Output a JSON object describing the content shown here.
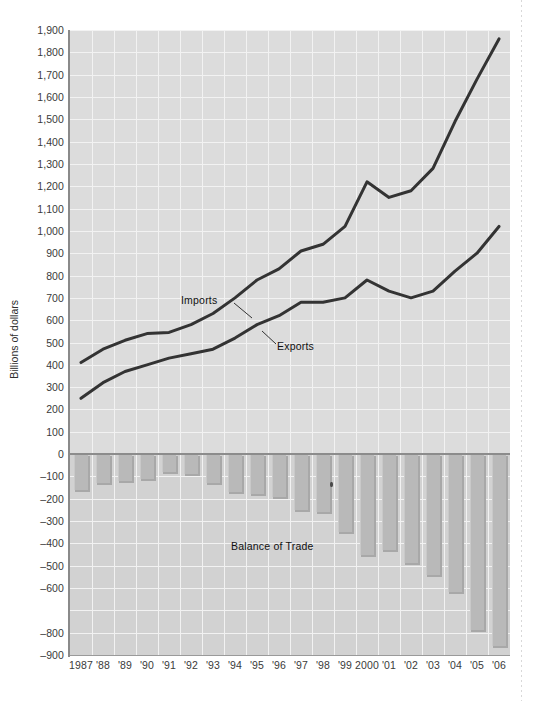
{
  "figure": {
    "ytitle": "Billions of dollars",
    "annotations": {
      "imports": "Imports",
      "exports": "Exports",
      "balance": "Balance of Trade"
    }
  },
  "chart_data": {
    "type": "line",
    "title": "",
    "xlabel": "",
    "ylabel": "Billions of dollars",
    "grid": true,
    "legend_position": "inline-annotations",
    "ylim": [
      -900,
      1900
    ],
    "x": [
      1987,
      1988,
      1989,
      1990,
      1991,
      1992,
      1993,
      1994,
      1995,
      1996,
      1997,
      1998,
      1999,
      2000,
      2001,
      2002,
      2003,
      2004,
      2005,
      2006
    ],
    "categories": [
      "1987",
      "'88",
      "'89",
      "'90",
      "'91",
      "'92",
      "'93",
      "'94",
      "'95",
      "'96",
      "'97",
      "'98",
      "'99",
      "2000",
      "'01",
      "'02",
      "'03",
      "'04",
      "'05",
      "'06"
    ],
    "ytick_labels": [
      "1,900",
      "1,800",
      "1,700",
      "1,600",
      "1,500",
      "1,400",
      "1,300",
      "1,200",
      "1,100",
      "1,000",
      "900",
      "800",
      "700",
      "600",
      "500",
      "400",
      "300",
      "200",
      "100",
      "0",
      "–100",
      "–200",
      "–300",
      "–400",
      "–500",
      "–600",
      "–800",
      "–900"
    ],
    "ytick_values": [
      1900,
      1800,
      1700,
      1600,
      1500,
      1400,
      1300,
      1200,
      1100,
      1000,
      900,
      800,
      700,
      600,
      500,
      400,
      300,
      200,
      100,
      0,
      -100,
      -200,
      -300,
      -400,
      -500,
      -600,
      -700,
      -800,
      -900
    ],
    "note": "Y-axis tick labels as printed skip –700 (original figure typo); gridline spacing remains uniform.",
    "series": [
      {
        "name": "Imports",
        "type": "line",
        "color": "#333333",
        "values": [
          410,
          470,
          510,
          540,
          545,
          580,
          630,
          700,
          780,
          830,
          910,
          940,
          1020,
          1220,
          1150,
          1180,
          1280,
          1490,
          1680,
          1860
        ]
      },
      {
        "name": "Exports",
        "type": "line",
        "color": "#333333",
        "values": [
          250,
          320,
          370,
          400,
          430,
          450,
          470,
          520,
          580,
          620,
          680,
          680,
          700,
          780,
          730,
          700,
          730,
          820,
          900,
          1020
        ]
      },
      {
        "name": "Balance of Trade",
        "type": "bar",
        "color": "#b9b9b9",
        "values": [
          -160,
          -130,
          -120,
          -110,
          -80,
          -90,
          -130,
          -170,
          -180,
          -190,
          -250,
          -260,
          -350,
          -450,
          -430,
          -490,
          -540,
          -620,
          -790,
          -860
        ]
      }
    ]
  },
  "colors": {
    "plot_background_upper": "#dcdcdc",
    "plot_background_lower": "#d2d2d2",
    "gridline": "#f2f2f2",
    "line": "#333333",
    "bar": "#b9b9b9",
    "zero_line": "#8c8c8c",
    "text": "#3a3a3a"
  }
}
